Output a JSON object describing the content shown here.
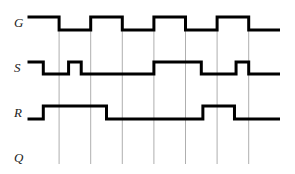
{
  "diagram": {
    "type": "timing-diagram",
    "time_divisions": 8,
    "signals": [
      {
        "name": "G",
        "label": "G",
        "levels": [
          1,
          0,
          1,
          0,
          1,
          0,
          1,
          0
        ],
        "transitions_note": "square clock"
      },
      {
        "name": "S",
        "label": "S",
        "segments": [
          [
            0,
            1
          ],
          [
            0.5,
            0
          ],
          [
            1.3,
            1
          ],
          [
            1.7,
            0
          ],
          [
            4,
            1
          ],
          [
            5.5,
            0
          ],
          [
            6.6,
            1
          ],
          [
            7,
            0
          ]
        ]
      },
      {
        "name": "R",
        "label": "R",
        "segments": [
          [
            0,
            0
          ],
          [
            0.5,
            1
          ],
          [
            2.5,
            0
          ],
          [
            5.55,
            1
          ],
          [
            6.55,
            0
          ]
        ]
      },
      {
        "name": "Q",
        "label": "Q",
        "segments": []
      }
    ],
    "clock_edges": [
      1,
      2,
      3,
      4,
      5,
      6,
      7
    ]
  }
}
